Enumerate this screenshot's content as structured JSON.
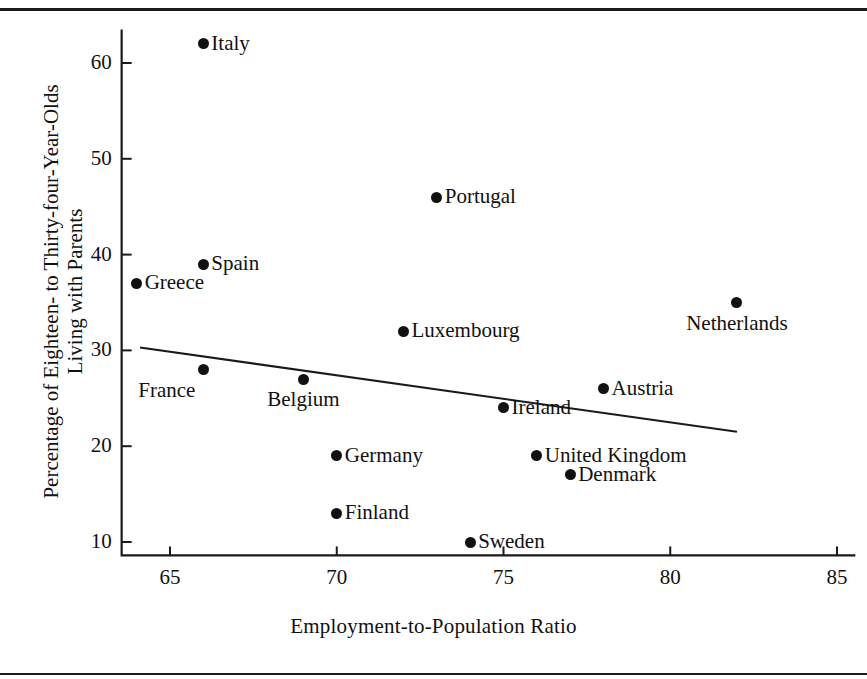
{
  "chart_data": {
    "type": "scatter",
    "title": "",
    "xlabel": "Employment-to-Population Ratio",
    "ylabel": "Percentage of Eighteen- to Thirty-four-Year-Olds Living with Parents",
    "ylabel_line1": "Percentage of Eighteen- to Thirty-four-Year-Olds",
    "ylabel_line2": "Living with Parents",
    "xlim": [
      63,
      85.6
    ],
    "ylim": [
      8.5,
      63.5
    ],
    "xticks": [
      65,
      70,
      75,
      80,
      85
    ],
    "yticks": [
      10,
      20,
      30,
      40,
      50,
      60
    ],
    "grid": false,
    "legend": false,
    "point_color": "#111111",
    "line_color": "#1a1a1a",
    "points": [
      {
        "label": "Italy",
        "x": 66,
        "y": 62,
        "label_pos": "right"
      },
      {
        "label": "Portugal",
        "x": 73,
        "y": 46,
        "label_pos": "right"
      },
      {
        "label": "Spain",
        "x": 66,
        "y": 39,
        "label_pos": "right"
      },
      {
        "label": "Greece",
        "x": 64,
        "y": 37,
        "label_pos": "right"
      },
      {
        "label": "Netherlands",
        "x": 82,
        "y": 35,
        "label_pos": "below"
      },
      {
        "label": "Luxembourg",
        "x": 72,
        "y": 32,
        "label_pos": "right"
      },
      {
        "label": "France",
        "x": 66,
        "y": 28,
        "label_pos": "below-left"
      },
      {
        "label": "Belgium",
        "x": 69,
        "y": 27,
        "label_pos": "below"
      },
      {
        "label": "Austria",
        "x": 78,
        "y": 26,
        "label_pos": "right"
      },
      {
        "label": "Ireland",
        "x": 75,
        "y": 24,
        "label_pos": "right"
      },
      {
        "label": "Germany",
        "x": 70,
        "y": 19,
        "label_pos": "right"
      },
      {
        "label": "United Kingdom",
        "x": 76,
        "y": 19,
        "label_pos": "right"
      },
      {
        "label": "Denmark",
        "x": 77,
        "y": 17,
        "label_pos": "right"
      },
      {
        "label": "Finland",
        "x": 70,
        "y": 13,
        "label_pos": "right"
      },
      {
        "label": "Sweden",
        "x": 74,
        "y": 10,
        "label_pos": "right"
      }
    ],
    "trendline": {
      "x0": 64.1,
      "y0": 30.3,
      "x1": 82.0,
      "y1": 21.5
    }
  }
}
